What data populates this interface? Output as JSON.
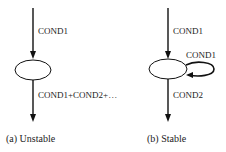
{
  "diagrams": [
    {
      "id": "a",
      "caption": "(a)  Unstable",
      "in_label": "COND1",
      "out_label": "COND1+COND2+…"
    },
    {
      "id": "b",
      "caption": "(b)  Stable",
      "in_label": "COND1",
      "loop_label": "COND1",
      "out_label": "COND2"
    }
  ]
}
